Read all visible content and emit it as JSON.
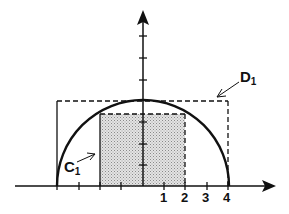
{
  "diagram": {
    "type": "geometry",
    "x_axis": {
      "tick_values": [
        -4,
        -3,
        -2,
        -1,
        0,
        1,
        2,
        3,
        4
      ],
      "labeled_ticks": [
        "1",
        "2",
        "3",
        "4"
      ]
    },
    "y_axis": {
      "tick_count_above_origin": 7
    },
    "semicircle": {
      "radius": 4,
      "center": [
        0,
        0
      ]
    },
    "rect_D1": {
      "x_min": -4,
      "x_max": 4,
      "y_max": 4,
      "label": "D",
      "label_sub": "1"
    },
    "rect_C1": {
      "x_min": -2,
      "x_max": 2,
      "y_max": 3.46,
      "shaded": true,
      "label": "C",
      "label_sub": "1"
    },
    "colors": {
      "stroke": "#111111",
      "shade": "#c8c8c8"
    }
  }
}
